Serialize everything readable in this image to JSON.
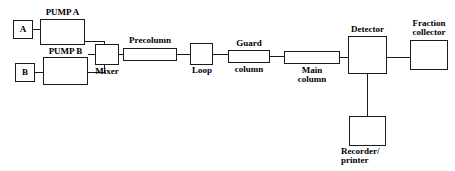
{
  "diagram": {
    "type": "block-flow-diagram",
    "canvas": {
      "width": 455,
      "height": 171
    },
    "colors": {
      "stroke": "#1a1a1a",
      "background": "#ffffff",
      "text": "#000000"
    }
  },
  "nodes": {
    "solvent_a": {
      "label": "A",
      "x": 13,
      "y": 20,
      "w": 20,
      "h": 19,
      "font_size": 9
    },
    "pump_a": {
      "label": "PUMP A",
      "x": 40,
      "y": 19,
      "w": 45,
      "h": 26,
      "font_size": 9
    },
    "solvent_b": {
      "label": "B",
      "x": 15,
      "y": 63,
      "w": 20,
      "h": 19,
      "font_size": 9
    },
    "pump_b": {
      "label": "PUMP B",
      "x": 43,
      "y": 57,
      "w": 45,
      "h": 28,
      "font_size": 9
    },
    "mixer": {
      "label": "Mixer",
      "x": 95,
      "y": 44,
      "w": 24,
      "h": 21,
      "font_size": 9
    },
    "precolumn": {
      "label": "Precolumn",
      "x": 123,
      "y": 48,
      "w": 54,
      "h": 13,
      "font_size": 9
    },
    "loop": {
      "label": "Loop",
      "x": 190,
      "y": 43,
      "w": 23,
      "h": 22,
      "font_size": 9
    },
    "guard_column": {
      "label_top": "Guard",
      "label_bottom": "column",
      "x": 228,
      "y": 50,
      "w": 42,
      "h": 13,
      "font_size": 9
    },
    "main_column": {
      "label_top": "Main",
      "label_bottom": "column",
      "x": 284,
      "y": 51,
      "w": 56,
      "h": 13,
      "font_size": 9
    },
    "detector": {
      "label": "Detector",
      "x": 348,
      "y": 36,
      "w": 39,
      "h": 38,
      "font_size": 9
    },
    "fraction_collector": {
      "label_top": "Fraction",
      "label_bottom": "collector",
      "x": 410,
      "y": 40,
      "w": 38,
      "h": 30,
      "font_size": 9
    },
    "recorder_printer": {
      "label_top": "Recorder/",
      "label_bottom": "printer",
      "x": 349,
      "y": 116,
      "w": 37,
      "h": 30,
      "font_size": 9
    }
  },
  "labels": {
    "solvent_a": "A",
    "pump_a": "PUMP A",
    "solvent_b": "B",
    "pump_b": "PUMP B",
    "mixer": "Mixer",
    "precolumn": "Precolumn",
    "loop": "Loop",
    "guard_top": "Guard",
    "guard_bottom": "column",
    "main_top": "Main",
    "main_bottom": "column",
    "detector": "Detector",
    "fraction_top": "Fraction",
    "fraction_bottom": "collector",
    "recorder_top": "Recorder/",
    "recorder_bottom": "printer"
  },
  "connections": [
    {
      "name": "a-to-pump-a",
      "from": "solvent_a",
      "to": "pump_a"
    },
    {
      "name": "b-to-pump-b",
      "from": "solvent_b",
      "to": "pump_b"
    },
    {
      "name": "pump-a-to-junction",
      "from": "pump_a",
      "to": "merge_junction"
    },
    {
      "name": "pump-b-to-junction",
      "from": "pump_b",
      "to": "merge_junction"
    },
    {
      "name": "junction-to-mixer",
      "from": "merge_junction",
      "to": "mixer"
    },
    {
      "name": "mixer-to-precolumn",
      "from": "mixer",
      "to": "precolumn"
    },
    {
      "name": "precolumn-to-loop",
      "from": "precolumn",
      "to": "loop"
    },
    {
      "name": "loop-to-guard-column",
      "from": "loop",
      "to": "guard_column"
    },
    {
      "name": "guard-column-to-main-column",
      "from": "guard_column",
      "to": "main_column"
    },
    {
      "name": "main-column-to-detector",
      "from": "main_column",
      "to": "detector"
    },
    {
      "name": "detector-to-fraction-collector",
      "from": "detector",
      "to": "fraction_collector"
    },
    {
      "name": "detector-to-recorder-printer",
      "from": "detector",
      "to": "recorder_printer"
    }
  ]
}
